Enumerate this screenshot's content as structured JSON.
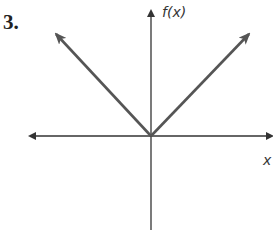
{
  "problem_number": "3.",
  "y_axis_label": "f(x)",
  "x_axis_label": "x",
  "colors": {
    "axis": "#333333",
    "graph": "#555555"
  },
  "graph": {
    "type": "absolute-value",
    "vertex": [
      0,
      0
    ],
    "description": "V-shaped graph with vertex at origin, arrows extending up-left and up-right"
  }
}
